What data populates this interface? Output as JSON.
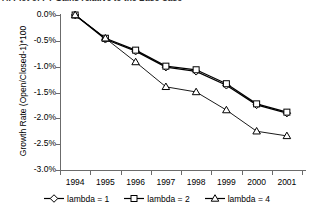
{
  "title": {
    "text": "A: Plot of PT Gains relative to the Base Case",
    "clipped": true
  },
  "chart_data": {
    "type": "line",
    "title": "A: Plot of PT Gains relative to the Base Case",
    "xlabel": "",
    "ylabel": "Growth Rate (Open/Closed-1)*100",
    "categories": [
      "1994",
      "1995",
      "1996",
      "1997",
      "1998",
      "1999",
      "2000",
      "2001"
    ],
    "x": [
      1994,
      1995,
      1996,
      1997,
      1998,
      1999,
      2000,
      2001
    ],
    "ylim": [
      -3.0,
      0.0
    ],
    "yticks": [
      "0.0%",
      "-0.5%",
      "-1.0%",
      "-1.5%",
      "-2.0%",
      "-2.5%",
      "-3.0%"
    ],
    "ytick_values": [
      0.0,
      -0.5,
      -1.0,
      -1.5,
      -2.0,
      -2.5,
      -3.0
    ],
    "grid": false,
    "legend_position": "bottom",
    "series": [
      {
        "name": "lambda = 1",
        "marker": "diamond",
        "color": "#000000",
        "values": [
          0.0,
          -0.47,
          -0.7,
          -1.01,
          -1.09,
          -1.36,
          -1.74,
          -1.9
        ]
      },
      {
        "name": "lambda = 2",
        "marker": "square",
        "color": "#000000",
        "values": [
          0.0,
          -0.45,
          -0.68,
          -0.99,
          -1.06,
          -1.33,
          -1.72,
          -1.88
        ]
      },
      {
        "name": "lambda = 4",
        "marker": "triangle",
        "color": "#000000",
        "values": [
          0.0,
          -0.45,
          -0.91,
          -1.39,
          -1.49,
          -1.84,
          -2.25,
          -2.34
        ]
      }
    ]
  },
  "legend": {
    "entries": [
      {
        "label": "lambda = 1",
        "marker": "diamond"
      },
      {
        "label": "lambda = 2",
        "marker": "square"
      },
      {
        "label": "lambda = 4",
        "marker": "triangle"
      }
    ]
  }
}
